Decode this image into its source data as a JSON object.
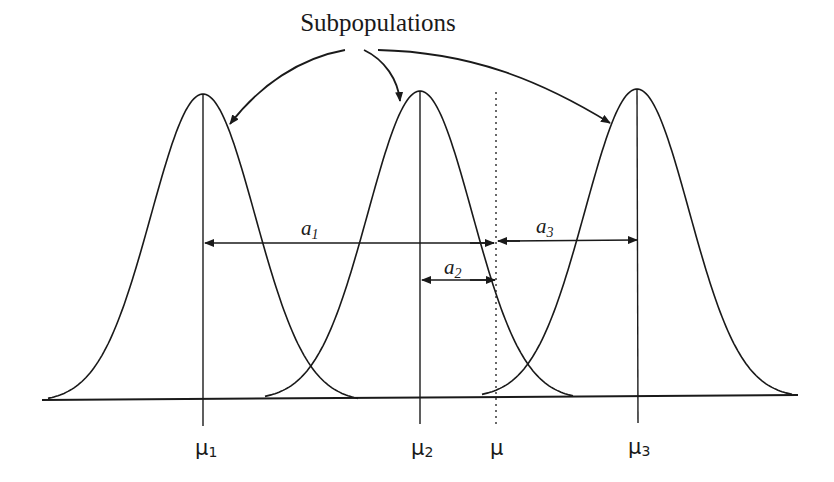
{
  "title": "Subpopulations",
  "axis_labels": {
    "mu1": {
      "base": "μ",
      "sub": "1"
    },
    "mu2": {
      "base": "μ",
      "sub": "2"
    },
    "mu": {
      "base": "μ",
      "sub": ""
    },
    "mu3": {
      "base": "μ",
      "sub": "3"
    }
  },
  "distance_labels": {
    "a1": {
      "base": "a",
      "sub": "1"
    },
    "a2": {
      "base": "a",
      "sub": "2"
    },
    "a3": {
      "base": "a",
      "sub": "3"
    }
  },
  "colors": {
    "ink": "#1a1a1a",
    "background": "#ffffff"
  },
  "chart_data": {
    "type": "diagram",
    "curves": [
      {
        "name": "subpopulation 1",
        "mean_label": "μ1",
        "peak_x": 203
      },
      {
        "name": "subpopulation 2",
        "mean_label": "μ2",
        "peak_x": 420
      },
      {
        "name": "subpopulation 3",
        "mean_label": "μ3",
        "peak_x": 637
      }
    ],
    "overall_mean": {
      "label": "μ",
      "x": 496,
      "style": "dotted"
    },
    "distances": [
      {
        "label": "a1",
        "from": "μ1",
        "to": "μ"
      },
      {
        "label": "a2",
        "from": "μ2",
        "to": "μ"
      },
      {
        "label": "a3",
        "from": "μ3",
        "to": "μ"
      }
    ],
    "annotation": "Subpopulations (arrows pointing to each of the three curves)"
  }
}
